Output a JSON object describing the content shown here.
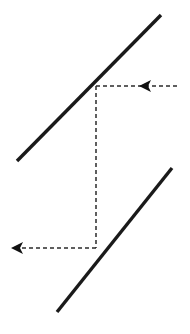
{
  "figure": {
    "canvas": {
      "width": 190,
      "height": 334,
      "background": "#ffffff"
    },
    "colors": {
      "solid_line": "#1a1a1a",
      "dashed_line": "#2b2b2b",
      "arrow_head": "#111111",
      "background": "#ffffff"
    },
    "style": {
      "solid_stroke_width": 3.4,
      "dashed_stroke_width": 1.5,
      "dash_pattern": "4 3"
    },
    "solid_lines": [
      {
        "name": "upper-line",
        "x1": 17,
        "y1": 161,
        "x2": 161,
        "y2": 15,
        "slope": -1.01
      },
      {
        "name": "lower-line",
        "x1": 57,
        "y1": 312,
        "x2": 172,
        "y2": 168,
        "slope": -1.25
      }
    ],
    "dashed_segments": [
      {
        "name": "upper-horizontal-dashed",
        "orientation": "horizontal",
        "x1": 96,
        "y1": 86,
        "x2": 178,
        "y2": 86
      },
      {
        "name": "vertical-dashed",
        "orientation": "vertical",
        "x1": 96,
        "y1": 86,
        "x2": 96,
        "y2": 248
      },
      {
        "name": "lower-horizontal-dashed",
        "orientation": "horizontal",
        "x1": 96,
        "y1": 248,
        "x2": 14,
        "y2": 248
      }
    ],
    "arrow_heads": [
      {
        "name": "upper-left-pointing-arrowhead",
        "direction": "left",
        "tip_x": 139,
        "tip_y": 86,
        "points": "139,86 151,80 148,86 151,92"
      },
      {
        "name": "lower-left-pointing-arrowhead",
        "direction": "left",
        "tip_x": 11,
        "tip_y": 248,
        "points": "11,248 23,242 20,248 23,254"
      }
    ]
  }
}
